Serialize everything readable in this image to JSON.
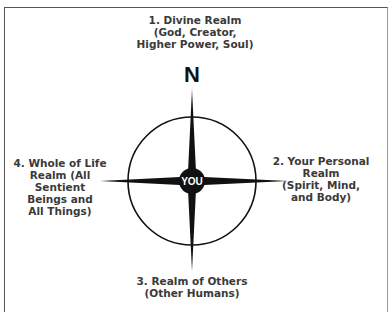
{
  "diagram": {
    "type": "compass-rose",
    "center_label": "YOU",
    "north_marker": "N",
    "realms": [
      {
        "position": "north",
        "lines": [
          "1. Divine Realm",
          "(God, Creator,",
          "Higher Power, Soul)"
        ]
      },
      {
        "position": "east",
        "lines": [
          "2. Your Personal Realm",
          "(Spirit, Mind,",
          "and Body)"
        ]
      },
      {
        "position": "south",
        "lines": [
          "3. Realm of Others",
          "(Other Humans)"
        ]
      },
      {
        "position": "west",
        "lines": [
          "4. Whole of Life",
          "Realm (All Sentient",
          "Beings and",
          "All Things)"
        ]
      }
    ]
  },
  "colors": {
    "ink": "#111111",
    "text": "#3a3a3a",
    "frame": "#555555",
    "background": "#ffffff"
  }
}
